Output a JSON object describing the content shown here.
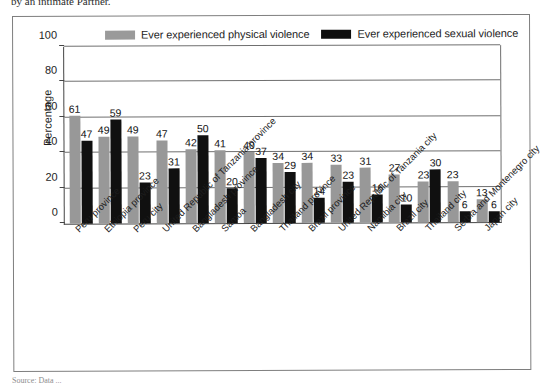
{
  "caption": {
    "top_fragment": "by an intimate Partner.",
    "bottom_fragment": "Source: Data ..."
  },
  "legend": {
    "items": [
      {
        "label": "Ever experienced physical violence",
        "color": "#989898",
        "swatch": "physical"
      },
      {
        "label": "Ever experienced sexual violence",
        "color": "#101010",
        "swatch": "sexual"
      }
    ]
  },
  "axes": {
    "y_title": "Percentage",
    "y_ticks": [
      "0",
      "20",
      "40",
      "60",
      "80",
      "100"
    ]
  },
  "chart_data": {
    "type": "bar",
    "title": "",
    "xlabel": "",
    "ylabel": "Percentage",
    "ylim": [
      0,
      100
    ],
    "grid": true,
    "legend_position": "top",
    "categories": [
      "Peru province",
      "Ethiopia province",
      "Peru city",
      "United Republic of Tanzania province",
      "Bangladesh province",
      "Samoa",
      "Bangladesh city",
      "Thailand province",
      "Brazil province",
      "United Republic of Tanzania city",
      "Namibia city",
      "Brazil city",
      "Thailand city",
      "Serbia and Montenegro city",
      "Japan city"
    ],
    "series": [
      {
        "name": "Ever experienced physical violence",
        "color": "#989898",
        "values": [
          61,
          49,
          49,
          47,
          42,
          41,
          40,
          34,
          34,
          33,
          31,
          27,
          23,
          23,
          13
        ]
      },
      {
        "name": "Ever experienced sexual violence",
        "color": "#101010",
        "values": [
          47,
          59,
          23,
          31,
          50,
          20,
          37,
          29,
          14,
          23,
          16,
          10,
          30,
          6,
          6
        ]
      }
    ]
  }
}
